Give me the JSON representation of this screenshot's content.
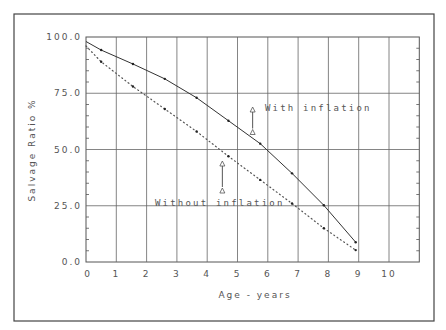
{
  "chart_data": {
    "type": "line",
    "title": "",
    "xlabel": "Age - years",
    "ylabel": "Salvage Ratio %",
    "xlim": [
      0,
      11
    ],
    "ylim": [
      0,
      100
    ],
    "x_ticks": [
      "0",
      "1",
      "2",
      "3",
      "4",
      "5",
      "6",
      "7",
      "8",
      "9",
      "10"
    ],
    "y_ticks": [
      "0.0",
      "25.0",
      "50.0",
      "75.0",
      "100.0"
    ],
    "grid": true,
    "legend": "none",
    "series": [
      {
        "name": "With inflation",
        "style": "solid",
        "x": [
          0,
          0.5,
          1.55,
          2.6,
          3.65,
          4.7,
          5.75,
          6.8,
          7.85,
          8.9
        ],
        "y": [
          98,
          94.2,
          88,
          81.4,
          73,
          62.8,
          52.6,
          39.4,
          25.2,
          8.8
        ]
      },
      {
        "name": "Without inflation",
        "style": "dotted",
        "x": [
          0,
          0.5,
          1.55,
          2.6,
          3.65,
          4.7,
          5.75,
          6.8,
          7.85,
          8.9
        ],
        "y": [
          96,
          89,
          78,
          68,
          58,
          47,
          36.5,
          26,
          15,
          5.3
        ]
      }
    ],
    "annotations": [
      {
        "text": "With inflation",
        "arrow_x": 5.5,
        "arrow_y": [
          58,
          68
        ]
      },
      {
        "text": "Without inflation",
        "arrow_x": 4.5,
        "arrow_y": [
          32,
          44
        ]
      }
    ]
  }
}
